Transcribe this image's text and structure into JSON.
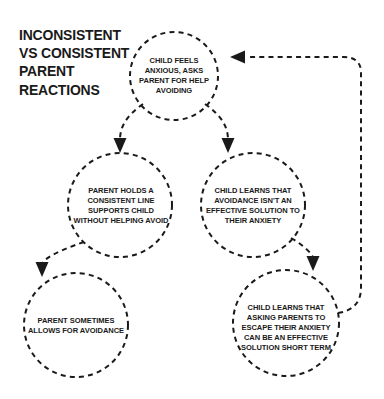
{
  "diagram": {
    "title_lines": [
      "INCONSISTENT",
      "VS CONSISTENT",
      "PARENT",
      "REACTIONS"
    ],
    "title_full": "INCONSISTENT VS CONSISTENT PARENT REACTIONS",
    "colors": {
      "background": "#ffffff",
      "ink": "#1a1a1a",
      "stroke": "#1a1a1a"
    },
    "nodes": [
      {
        "id": "child-feels-anxious",
        "text": "CHILD FEELS ANXIOUS, ASKS PARENT FOR HELP AVOIDING"
      },
      {
        "id": "parent-holds-consistent-line",
        "text": "PARENT HOLDS A CONSISTENT LINE SUPPORTS CHILD WITHOUT HELPING AVOID"
      },
      {
        "id": "child-learns-avoidance-ineffective",
        "text": "CHILD LEARNS THAT AVOIDANCE ISN'T AN EFFECTIVE SOLUTION TO THEIR ANXIETY"
      },
      {
        "id": "parent-sometimes-allows-avoidance",
        "text": "PARENT SOMETIMES ALLOWS FOR AVOIDANCE"
      },
      {
        "id": "child-learns-escape-effective",
        "text": "CHILD LEARNS THAT ASKING PARENTS TO ESCAPE THEIR ANXIETY CAN BE AN EFFECTIVE SOLUTION SHORT TERM"
      }
    ],
    "edges": [
      {
        "id": "edge-anxious-to-parent-holds",
        "from": "child-feels-anxious",
        "to": "parent-holds-consistent-line"
      },
      {
        "id": "edge-anxious-to-child-learns",
        "from": "child-feels-anxious",
        "to": "child-learns-avoidance-ineffective"
      },
      {
        "id": "edge-parent-holds-to-sometimes-allows",
        "from": "parent-holds-consistent-line",
        "to": "parent-sometimes-allows-avoidance"
      },
      {
        "id": "edge-avoidance-ineffective-to-escape-effective",
        "from": "child-learns-avoidance-ineffective",
        "to": "child-learns-escape-effective"
      },
      {
        "id": "edge-escape-effective-to-anxious-feedback",
        "from": "child-learns-escape-effective",
        "to": "child-feels-anxious"
      }
    ]
  }
}
